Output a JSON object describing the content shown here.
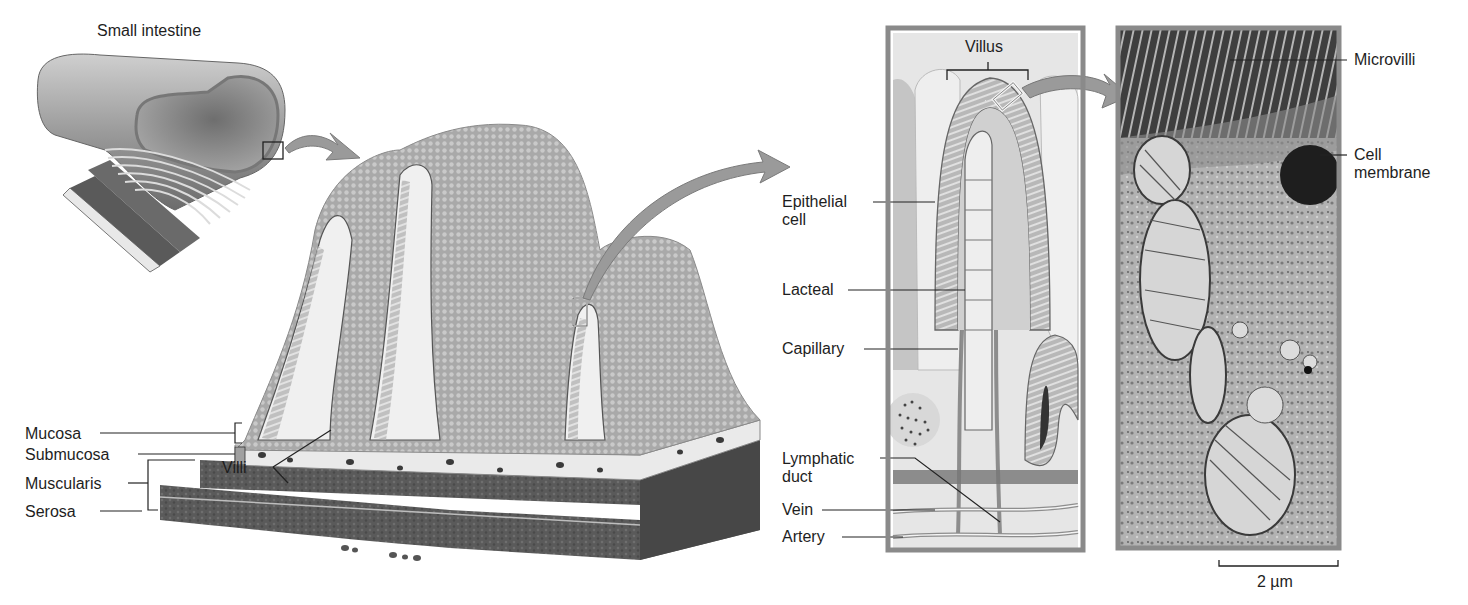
{
  "figure": {
    "panels": [
      {
        "id": "small-intestine",
        "title": "Small intestine"
      },
      {
        "id": "intestinal-wall",
        "labels": [
          "Villi",
          "Mucosa",
          "Submucosa",
          "Muscularis",
          "Serosa"
        ]
      },
      {
        "id": "villus-detail",
        "labels": [
          "Villus",
          "Epithelial cell",
          "Lacteal",
          "Capillary",
          "Lymphatic duct",
          "Vein",
          "Artery"
        ]
      },
      {
        "id": "micrograph",
        "labels": [
          "Microvilli",
          "Cell membrane"
        ],
        "scale_bar": "2 µm"
      }
    ]
  },
  "labels": {
    "small_intestine": "Small intestine",
    "villi": "Villi",
    "mucosa": "Mucosa",
    "submucosa": "Submucosa",
    "muscularis": "Muscularis",
    "serosa": "Serosa",
    "villus": "Villus",
    "epithelial_cell_1": "Epithelial",
    "epithelial_cell_2": "cell",
    "lacteal": "Lacteal",
    "capillary": "Capillary",
    "lymphatic_duct_1": "Lymphatic",
    "lymphatic_duct_2": "duct",
    "vein": "Vein",
    "artery": "Artery",
    "microvilli": "Microvilli",
    "cell_membrane_1": "Cell",
    "cell_membrane_2": "membrane",
    "scale_bar": "2 µm"
  },
  "colors": {
    "panel_border": "#8a8a8a",
    "arrow": "#9a9a9a",
    "tissue_light": "#d6d6d6",
    "tissue_mid": "#a8a8a8",
    "tissue_dark": "#5e5e5e",
    "muscle": "#555555"
  }
}
